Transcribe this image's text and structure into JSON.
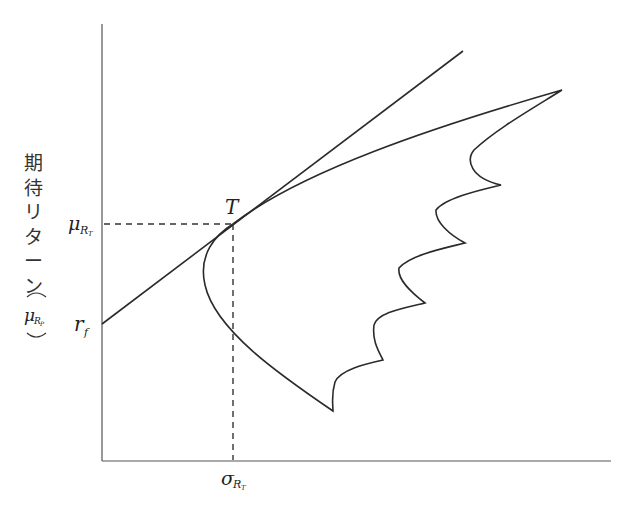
{
  "diagram": {
    "y_axis_label_chars": [
      "期",
      "待",
      "リ",
      "タ",
      "ー",
      "ン"
    ],
    "y_axis_symbol": {
      "base": "μ",
      "subscript": "R",
      "subsub": "P",
      "wrapped_in_parens": true
    },
    "labels": {
      "tangency_point": "T",
      "mu_T": {
        "base": "μ",
        "subscript": "R",
        "subsub": "T"
      },
      "rf": {
        "base": "r",
        "subscript": "f"
      },
      "sigma_T": {
        "base": "σ",
        "subscript": "R",
        "subsub": "T"
      }
    },
    "elements": [
      "y-axis",
      "x-axis",
      "capital-market-line",
      "efficient-frontier",
      "feasible-set-boundary",
      "dashed-guide-mu-T",
      "dashed-guide-sigma-T"
    ],
    "colors": {
      "line": "#2a2a2a",
      "axis": "#555555",
      "background": "#ffffff"
    }
  }
}
